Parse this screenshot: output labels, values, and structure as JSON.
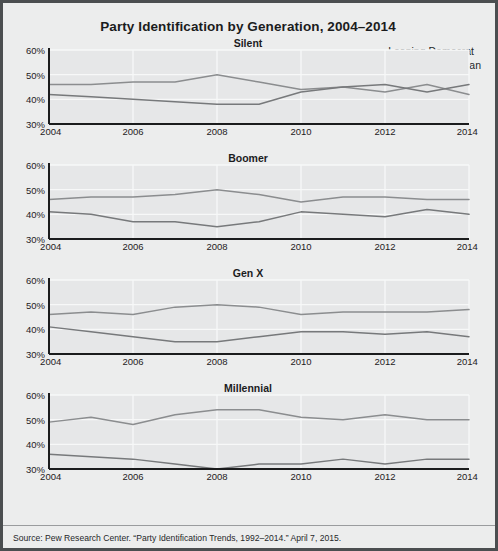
{
  "figure": {
    "title": "Party Identification by Generation, 2004–2014",
    "source": "Source: Pew Research Center. “Party Identification Trends, 1992–2014.” April 7, 2015.",
    "background_color": "#eceded",
    "border_color": "#4b4e50"
  },
  "legend": {
    "position": "top-right",
    "entries": [
      {
        "label": "Leaning Democrat",
        "color": "#8b8d8f"
      },
      {
        "label": "Leaning Republican",
        "color": "#77797b"
      }
    ]
  },
  "axes": {
    "y_ticks": [
      "30%",
      "40%",
      "50%",
      "60%"
    ],
    "x_ticks": [
      "2004",
      "2006",
      "2008",
      "2010",
      "2012",
      "2014"
    ]
  },
  "chart_data": [
    {
      "type": "line",
      "title": "Party Identification by Generation, 2004–2014",
      "subtitle": "Silent",
      "xlabel": "",
      "ylabel": "",
      "xlim": [
        2004,
        2014
      ],
      "ylim": [
        30,
        60
      ],
      "grid": true,
      "legend_position": "top-right",
      "x": [
        2004,
        2005,
        2006,
        2007,
        2008,
        2009,
        2010,
        2011,
        2012,
        2013,
        2014
      ],
      "series": [
        {
          "name": "Leaning Democrat",
          "values": [
            46,
            46,
            47,
            47,
            50,
            47,
            44,
            45,
            43,
            46,
            42
          ]
        },
        {
          "name": "Leaning Republican",
          "values": [
            42,
            41,
            40,
            39,
            38,
            38,
            43,
            45,
            46,
            43,
            46
          ]
        }
      ]
    },
    {
      "type": "line",
      "subtitle": "Boomer",
      "xlabel": "",
      "ylabel": "",
      "xlim": [
        2004,
        2014
      ],
      "ylim": [
        30,
        60
      ],
      "grid": true,
      "x": [
        2004,
        2005,
        2006,
        2007,
        2008,
        2009,
        2010,
        2011,
        2012,
        2013,
        2014
      ],
      "series": [
        {
          "name": "Leaning Democrat",
          "values": [
            46,
            47,
            47,
            48,
            50,
            48,
            45,
            47,
            47,
            46,
            46
          ]
        },
        {
          "name": "Leaning Republican",
          "values": [
            41,
            40,
            37,
            37,
            35,
            37,
            41,
            40,
            39,
            42,
            40
          ]
        }
      ]
    },
    {
      "type": "line",
      "subtitle": "Gen X",
      "xlabel": "",
      "ylabel": "",
      "xlim": [
        2004,
        2014
      ],
      "ylim": [
        30,
        60
      ],
      "grid": true,
      "x": [
        2004,
        2005,
        2006,
        2007,
        2008,
        2009,
        2010,
        2011,
        2012,
        2013,
        2014
      ],
      "series": [
        {
          "name": "Leaning Democrat",
          "values": [
            46,
            47,
            46,
            49,
            50,
            49,
            46,
            47,
            47,
            47,
            48
          ]
        },
        {
          "name": "Leaning Republican",
          "values": [
            41,
            39,
            37,
            35,
            35,
            37,
            39,
            39,
            38,
            39,
            37
          ]
        }
      ]
    },
    {
      "type": "line",
      "subtitle": "Millennial",
      "xlabel": "",
      "ylabel": "",
      "xlim": [
        2004,
        2014
      ],
      "ylim": [
        30,
        60
      ],
      "grid": true,
      "x": [
        2004,
        2005,
        2006,
        2007,
        2008,
        2009,
        2010,
        2011,
        2012,
        2013,
        2014
      ],
      "series": [
        {
          "name": "Leaning Democrat",
          "values": [
            49,
            51,
            48,
            52,
            54,
            54,
            51,
            50,
            52,
            50,
            50
          ]
        },
        {
          "name": "Leaning Republican",
          "values": [
            36,
            35,
            34,
            32,
            30,
            32,
            32,
            34,
            32,
            34,
            34
          ]
        }
      ]
    }
  ]
}
